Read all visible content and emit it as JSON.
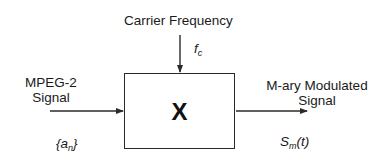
{
  "diagram": {
    "carrier": {
      "label": "Carrier Frequency",
      "symbol_base": "f",
      "symbol_sub": "c"
    },
    "input": {
      "label_line1": "MPEG-2",
      "label_line2": "Signal",
      "symbol_open": "{a",
      "symbol_sub": "n",
      "symbol_close": "}"
    },
    "block": {
      "operator": "X"
    },
    "output": {
      "label_line1": "M-ary Modulated",
      "label_line2": "Signal",
      "symbol_base": "S",
      "symbol_sub": "m",
      "symbol_tail": "(t)"
    },
    "colors": {
      "line": "#2a2a2a",
      "text": "#1a1a1a",
      "background": "#ffffff"
    }
  }
}
